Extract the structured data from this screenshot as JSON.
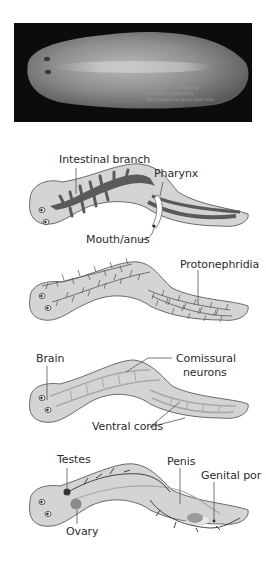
{
  "photo": {
    "caption_lines": [
      "Dugesia",
      "Schmidtea polychroa",
      "http://planaria.neuro.utah.edu"
    ]
  },
  "panels": [
    {
      "id": "digestive",
      "labels": {
        "intestinal_branch": "Intestinal branch",
        "pharynx": "Pharynx",
        "mouth_anus": "Mouth/anus"
      }
    },
    {
      "id": "excretory",
      "labels": {
        "protonephridia": "Protonephridia"
      }
    },
    {
      "id": "nervous",
      "labels": {
        "brain": "Brain",
        "comissural_1": "Comissural",
        "comissural_2": "neurons",
        "ventral_cords": "Ventral cords"
      }
    },
    {
      "id": "reproductive",
      "labels": {
        "testes": "Testes",
        "penis": "Penis",
        "genital_pore": "Genital por",
        "ovary": "Ovary"
      }
    }
  ],
  "colors": {
    "body_fill": "#d4d4d4",
    "body_outline": "#6a6a6a",
    "gut": "#5a5a5a",
    "ovary": "#8a8a8a",
    "photo_bg": "#0c0c0c"
  }
}
